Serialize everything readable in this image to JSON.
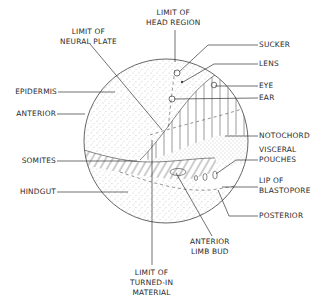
{
  "diagram": {
    "type": "embryo-fate-map",
    "colors": {
      "line": "#444444",
      "stipple": "#8a8a8a",
      "background": "#ffffff",
      "text": "#2a2a2a"
    },
    "labels": {
      "limit_neural_plate": {
        "line1": "LIMIT OF",
        "line2": "NEURAL PLATE"
      },
      "limit_head_region": {
        "line1": "LIMIT OF",
        "line2": "HEAD REGION"
      },
      "sucker": "SUCKER",
      "lens": "LENS",
      "eye": "EYE",
      "ear": "EAR",
      "epidermis": "EPIDERMIS",
      "anterior": "ANTERIOR",
      "notochord": "NOTOCHORD",
      "visceral_pouches": {
        "line1": "VISCERAL",
        "line2": "POUCHES"
      },
      "somites": "SOMITES",
      "lip_of_blastopore": {
        "line1": "LIP OF",
        "line2": "BLASTOPORE"
      },
      "hindgut": "HINDGUT",
      "posterior": "POSTERIOR",
      "anterior_limb_bud": {
        "line1": "ANTERIOR",
        "line2": "LIMB BUD"
      },
      "limit_turned_in": {
        "line1": "LIMIT OF",
        "line2": "TURNED-IN",
        "line3": "MATERIAL"
      }
    }
  }
}
